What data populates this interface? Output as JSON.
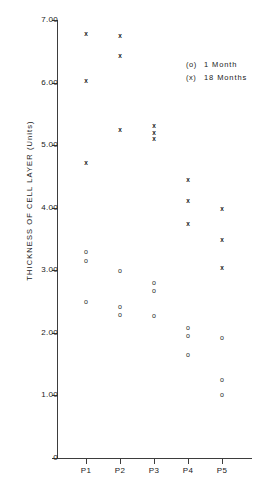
{
  "chart_data": {
    "type": "scatter",
    "title": "",
    "xlabel": "",
    "ylabel": "THICKNESS OF CELL LAYER  (Units)",
    "ylim": [
      0,
      7
    ],
    "yticks": [
      "0",
      "1.00",
      "2.00",
      "3.00",
      "4.00",
      "5.00",
      "6.00",
      "7.00"
    ],
    "ytick_values": [
      0,
      1,
      2,
      3,
      4,
      5,
      6,
      7
    ],
    "categories": [
      "P1",
      "P2",
      "P3",
      "P4",
      "P5"
    ],
    "grid": false,
    "legend_position": "top-right",
    "legend": [
      {
        "symbol": "(o)",
        "label": "1 Month"
      },
      {
        "symbol": "(x)",
        "label": "18 Months"
      }
    ],
    "series": [
      {
        "name": "1 Month",
        "marker": "o",
        "points": [
          {
            "category": "P1",
            "value": 3.3
          },
          {
            "category": "P1",
            "value": 3.15
          },
          {
            "category": "P1",
            "value": 2.5
          },
          {
            "category": "P2",
            "value": 3.0
          },
          {
            "category": "P2",
            "value": 2.42
          },
          {
            "category": "P2",
            "value": 2.3
          },
          {
            "category": "P3",
            "value": 2.8
          },
          {
            "category": "P3",
            "value": 2.68
          },
          {
            "category": "P3",
            "value": 2.28
          },
          {
            "category": "P4",
            "value": 2.08
          },
          {
            "category": "P4",
            "value": 1.95
          },
          {
            "category": "P4",
            "value": 1.65
          },
          {
            "category": "P5",
            "value": 1.92
          },
          {
            "category": "P5",
            "value": 1.25
          },
          {
            "category": "P5",
            "value": 1.02
          }
        ]
      },
      {
        "name": "18 Months",
        "marker": "x",
        "points": [
          {
            "category": "P1",
            "value": 6.78
          },
          {
            "category": "P1",
            "value": 6.03
          },
          {
            "category": "P1",
            "value": 4.72
          },
          {
            "category": "P2",
            "value": 6.76
          },
          {
            "category": "P2",
            "value": 6.43
          },
          {
            "category": "P2",
            "value": 5.25
          },
          {
            "category": "P3",
            "value": 5.32
          },
          {
            "category": "P3",
            "value": 5.2
          },
          {
            "category": "P3",
            "value": 5.1
          },
          {
            "category": "P4",
            "value": 4.45
          },
          {
            "category": "P4",
            "value": 4.12
          },
          {
            "category": "P4",
            "value": 3.75
          },
          {
            "category": "P5",
            "value": 3.98
          },
          {
            "category": "P5",
            "value": 3.5
          },
          {
            "category": "P5",
            "value": 3.05
          }
        ]
      }
    ]
  },
  "colors": {
    "axis": "#3d3d3d",
    "text": "#1a1a1a",
    "background": "#ffffff"
  }
}
